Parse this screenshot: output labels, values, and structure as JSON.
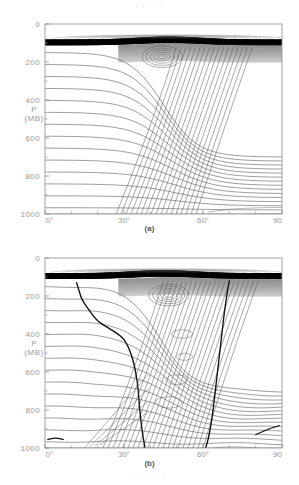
{
  "page": {
    "top_text_fragment": "· · · · ·",
    "bottom_text_fragment": "· · · · · ·"
  },
  "panels": [
    {
      "id": "a",
      "caption": "(a)",
      "y_axis": {
        "label_line1": "P",
        "label_line2": "(MB)",
        "ticks": [
          "0",
          "200",
          "400",
          "600",
          "800",
          "1000"
        ],
        "min": 0,
        "max": 1000,
        "inverted": true
      },
      "x_axis": {
        "ticks": [
          "0°",
          "30°",
          "60°",
          "90"
        ],
        "tick_values": [
          0,
          30,
          60,
          90
        ],
        "min": 0,
        "max": 90
      }
    },
    {
      "id": "b",
      "caption": "(b)",
      "y_axis": {
        "label_line1": "P",
        "label_line2": "(MB)",
        "ticks": [
          "0",
          "200",
          "400",
          "600",
          "800",
          "1000"
        ],
        "min": 0,
        "max": 1000,
        "inverted": true
      },
      "x_axis": {
        "ticks": [
          "0°",
          "30°",
          "60°",
          "90"
        ],
        "tick_values": [
          0,
          30,
          60,
          90
        ],
        "min": 0,
        "max": 90
      }
    }
  ],
  "colors": {
    "axis": "#8c8c8c",
    "tick_text": "#9a9a9a",
    "contour_thin": "#555555",
    "contour_thick": "#111111",
    "dense_band": "#000000",
    "background": "#ffffff"
  },
  "chart_data": {
    "type": "line",
    "title": "",
    "xlabel": "",
    "ylabel": "P (MB)",
    "xlim": [
      0,
      90
    ],
    "ylim": [
      1000,
      0
    ],
    "grid": false,
    "legend": "none",
    "panel_count": 2,
    "description_a": "Cross-section of isentropic surfaces (potential temperature contours) versus latitude and pressure, showing a deformed frontal zone with a closed spiral near 45 deg at 150 MB; dense near-horizontal contours form a dark stratospheric band above 100 MB.",
    "description_b": "Same cross-section with additional heavy contours marking the tropopause / frontal boundary, one descending from 40 deg near 100 MB to 1000 MB and another near 62-70 deg.",
    "panels": [
      {
        "name": "(a)",
        "series": [
          {
            "name": "isentrope-horizontal-left",
            "x": [
              0,
              10,
              20,
              25,
              30,
              35,
              40,
              45,
              50,
              55,
              60,
              65,
              70,
              80,
              90
            ],
            "values": [
              180,
              182,
              186,
              192,
              205,
              230,
              270,
              330,
              420,
              530,
              640,
              720,
              760,
              780,
              788
            ]
          },
          {
            "name": "isentrope-mid",
            "x": [
              0,
              10,
              20,
              25,
              30,
              35,
              40,
              45,
              50,
              55,
              60,
              70,
              80,
              90
            ],
            "values": [
              300,
              302,
              308,
              320,
              342,
              380,
              440,
              520,
              620,
              720,
              800,
              855,
              872,
              880
            ]
          },
          {
            "name": "isentrope-low",
            "x": [
              0,
              10,
              20,
              30,
              35,
              40,
              45,
              50,
              55,
              60,
              70,
              80,
              90
            ],
            "values": [
              440,
              442,
              448,
              468,
              495,
              540,
              605,
              690,
              780,
              850,
              910,
              932,
              940
            ]
          },
          {
            "name": "isentrope-lowest",
            "x": [
              0,
              10,
              20,
              30,
              40,
              45,
              50,
              55,
              60,
              70,
              80,
              90
            ],
            "values": [
              640,
              642,
              648,
              665,
              710,
              760,
              825,
              890,
              940,
              975,
              988,
              992
            ]
          },
          {
            "name": "frontal-zone-slope",
            "x": [
              28,
              34,
              40,
              46,
              52,
              56,
              60
            ],
            "values": [
              1000,
              860,
              700,
              520,
              340,
              230,
              160
            ]
          },
          {
            "name": "stratospheric-band-top",
            "x": [
              0,
              30,
              45,
              55,
              70,
              90
            ],
            "values": [
              88,
              86,
              70,
              76,
              90,
              92
            ]
          },
          {
            "name": "stratospheric-band-bottom",
            "x": [
              0,
              30,
              45,
              55,
              70,
              90
            ],
            "values": [
              108,
              106,
              96,
              100,
              110,
              112
            ]
          }
        ]
      },
      {
        "name": "(b)",
        "series": [
          {
            "name": "isentrope-horizontal-left",
            "x": [
              0,
              10,
              20,
              30,
              40,
              45,
              50,
              55,
              60,
              70,
              80,
              90
            ],
            "values": [
              185,
              186,
              192,
              212,
              270,
              330,
              420,
              530,
              640,
              745,
              775,
              785
            ]
          },
          {
            "name": "isentrope-mid",
            "x": [
              0,
              10,
              20,
              30,
              40,
              45,
              50,
              55,
              60,
              70,
              80,
              90
            ],
            "values": [
              320,
              322,
              330,
              355,
              430,
              510,
              610,
              710,
              790,
              850,
              868,
              876
            ]
          },
          {
            "name": "isentrope-low",
            "x": [
              0,
              10,
              20,
              30,
              40,
              45,
              50,
              55,
              60,
              70,
              80,
              90
            ],
            "values": [
              470,
              472,
              480,
              505,
              570,
              640,
              720,
              800,
              860,
              912,
              930,
              938
            ]
          },
          {
            "name": "tropopause-fold-left",
            "x": [
              12,
              13,
              14,
              16,
              20,
              26,
              30,
              33,
              35,
              36,
              37,
              38
            ],
            "values": [
              130,
              175,
              215,
              260,
              330,
              385,
              430,
              520,
              650,
              800,
              920,
              1000
            ]
          },
          {
            "name": "tropopause-fold-right",
            "x": [
              70,
              69,
              68,
              67,
              66,
              65,
              64,
              63,
              62,
              61
            ],
            "values": [
              120,
              200,
              300,
              420,
              540,
              660,
              780,
              880,
              950,
              1000
            ]
          },
          {
            "name": "frontal-zone-slope",
            "x": [
              24,
              30,
              36,
              42,
              48,
              54,
              58
            ],
            "values": [
              1000,
              870,
              720,
              550,
              370,
              230,
              150
            ]
          },
          {
            "name": "stratospheric-band-top",
            "x": [
              0,
              28,
              42,
              52,
              68,
              90
            ],
            "values": [
              86,
              84,
              66,
              72,
              88,
              90
            ]
          },
          {
            "name": "stratospheric-band-bottom",
            "x": [
              0,
              28,
              42,
              52,
              68,
              90
            ],
            "values": [
              110,
              108,
              96,
              102,
              112,
              114
            ]
          }
        ]
      }
    ]
  }
}
